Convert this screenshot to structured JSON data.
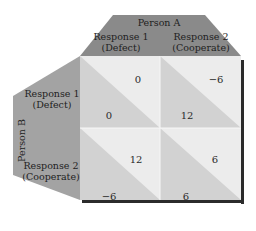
{
  "matrix": {
    "column_player": "Person A",
    "row_player": "Person B",
    "columns": [
      {
        "line1": "Response 1",
        "line2": "(Defect)"
      },
      {
        "line1": "Response 2",
        "line2": "(Cooperate)"
      }
    ],
    "rows": [
      {
        "line1": "Response 1",
        "line2": "(Defect)"
      },
      {
        "line1": "Response 2",
        "line2": "(Cooperate)"
      }
    ],
    "cells": [
      [
        {
          "a_payoff": "0",
          "b_payoff": "0"
        },
        {
          "a_payoff": "−6",
          "b_payoff": "12"
        }
      ],
      [
        {
          "a_payoff": "12",
          "b_payoff": "−6"
        },
        {
          "a_payoff": "6",
          "b_payoff": "6"
        }
      ]
    ]
  },
  "colors": {
    "header_fill": "#8a8a8a",
    "side_fill": "#a3a3a3",
    "cell_light": "#ececec",
    "cell_dark": "#d2d2d2",
    "shadow": "#2b2b2b"
  }
}
